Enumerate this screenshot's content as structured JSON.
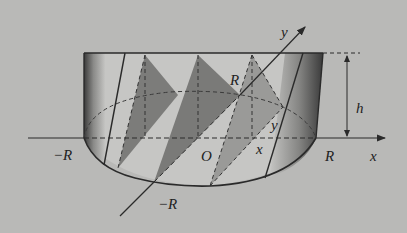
{
  "figure": {
    "labels": {
      "neg_R_left": "−R",
      "origin": "O",
      "x_point": "x",
      "R_right": "R",
      "x_axis": "x",
      "R_on_y": "R",
      "y_point": "y",
      "height": "h",
      "neg_R_bottom": "−R",
      "y_axis": "y"
    },
    "colors": {
      "background": "#b9b9b7",
      "line": "#2a2a2a",
      "triangle_dark": "#7c7c7a",
      "triangle_light": "#9a9a98",
      "base_face": "#c6c6c4"
    }
  }
}
